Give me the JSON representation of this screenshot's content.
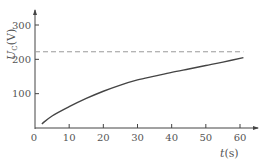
{
  "chart_data": {
    "type": "line",
    "title": "",
    "xlabel": "t(s)",
    "ylabel": "U_C(V)",
    "xlabel_var": "t",
    "xlabel_unit": "(s)",
    "ylabel_var": "U",
    "ylabel_sub": "C",
    "ylabel_unit": "(V)",
    "xlim": [
      0,
      65
    ],
    "ylim": [
      0,
      330
    ],
    "x_ticks": [
      0,
      10,
      20,
      30,
      40,
      50,
      60
    ],
    "y_ticks": [
      100,
      200,
      300
    ],
    "grid": false,
    "legend": null,
    "series": [
      {
        "name": "U_C charging curve",
        "style": "solid",
        "color": "#444444",
        "x": [
          2,
          5,
          10,
          15,
          20,
          25,
          30,
          35,
          40,
          45,
          50,
          55,
          61
        ],
        "values": [
          12,
          35,
          62,
          86,
          107,
          125,
          140,
          151,
          162,
          172,
          182,
          192,
          205
        ]
      },
      {
        "name": "asymptote",
        "style": "dashed",
        "color": "#999999",
        "x": [
          0,
          61
        ],
        "values": [
          222,
          222
        ]
      }
    ]
  }
}
